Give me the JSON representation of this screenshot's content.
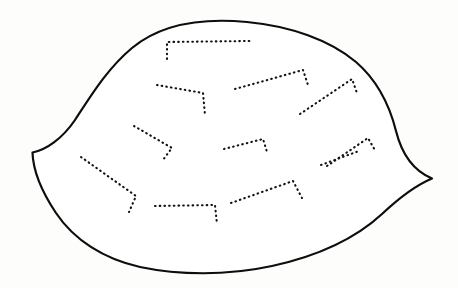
{
  "figure": {
    "title": "Dotted-vein outline figure",
    "kind": "line-art-diagram",
    "background_color": "#fdfdfc",
    "outline_color": "#0d0d0d",
    "vein_color": "#111111",
    "fill_color": "#ffffff",
    "canvas": {
      "width": 458,
      "height": 288
    },
    "outline": {
      "name": "body-outline",
      "description": "Closed leaf-like or shell-like contour with a concave notch and sharp point at the left and a sharp point at the right",
      "path": "M 32.5 152.5 C 46 150 62 139 75 120 C 92 94 108 68 132 48 C 162 23 205 18 247 22 C 290 26 330 40 356 62 C 378 81 390 107 396 131 C 402 155 414 171 432 178.5 C 414 186 398 199 382 214 C 356 238 318 256 272 266 C 226 276 178 275 140 267 C 104 259 74 240 56 213 C 40 189 33 169 32.5 152.5 Z",
      "key_points": {
        "left_notch_point": [
          32.5,
          152.5
        ],
        "top_apex": [
          215,
          21
        ],
        "right_point": [
          432,
          178.5
        ],
        "bottom_apex": [
          182,
          272
        ]
      }
    },
    "veins": [
      {
        "id": 1,
        "name": "vein-top-center",
        "description": "Horizontal dotted line high in the figure with a short vertical descender at its left end",
        "path": "M 167 59 L 167 42 L 250 41"
      },
      {
        "id": 2,
        "name": "vein-upper-left",
        "description": "Dotted line sloping down to the right with a short descender at its right end",
        "path": "M 157 85 L 203 93 L 205 115"
      },
      {
        "id": 3,
        "name": "vein-upper-right-inner",
        "description": "Dotted line rising to the right ending in a short down hook",
        "path": "M 235 89 L 303 70 L 308 85"
      },
      {
        "id": 4,
        "name": "vein-upper-right-outer",
        "description": "Dotted line rising to the right ending in a short down hook near the right edge",
        "path": "M 300 114 L 352 79 L 357 93"
      },
      {
        "id": 5,
        "name": "vein-mid-left",
        "description": "Dotted line sloping down to the right, turning into a short descender",
        "path": "M 134 126 L 172 148 L 163 160"
      },
      {
        "id": 6,
        "name": "vein-mid-center",
        "description": "Short dotted line rising to the right with a small down hook at the right end",
        "path": "M 224 149 L 263 139 L 267 152"
      },
      {
        "id": 7,
        "name": "vein-mid-right",
        "description": "Dotted line rising to the right with a short down hook at the right end",
        "path": "M 327 166 L 368 138 L 376 152"
      },
      {
        "id": 8,
        "name": "vein-lower-left",
        "description": "Long dotted line descending to the right with a short descender at the far end",
        "path": "M 81 157 L 136 196 L 129 212"
      },
      {
        "id": 9,
        "name": "vein-bottom-center",
        "description": "Horizontal dotted line low in the figure with a vertical descender at its right end",
        "path": "M 155 206 L 215 205 L 217 224"
      },
      {
        "id": 10,
        "name": "vein-bottom-right",
        "description": "Dotted line rising to the right ending with a short down hook",
        "path": "M 231 203 L 293 181 L 302 198"
      },
      {
        "id": 11,
        "name": "vein-lower-right-outer",
        "description": "Short dotted line rising to the right near the lower right region",
        "path": "M 321 165 L 359 151"
      }
    ]
  }
}
